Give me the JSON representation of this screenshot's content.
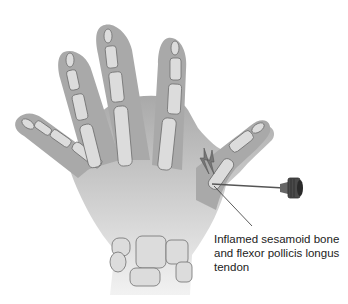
{
  "figure": {
    "annotation": {
      "lines": [
        "Inflamed sesamoid bone",
        "and flexor pollicis longus",
        "tendon"
      ]
    },
    "colors": {
      "background": "#ffffff",
      "skin": "#a9a9a9",
      "skin_outline": "#8e8e8e",
      "bone": "#dcdcdc",
      "bone_outline": "#6f6f6f",
      "needle": "#555555",
      "syringe_hub": "#3a3a3a",
      "text": "#222222"
    },
    "icons": {
      "pain_marker": "lightning-bolt-icon",
      "needle": "syringe-needle-icon"
    }
  }
}
